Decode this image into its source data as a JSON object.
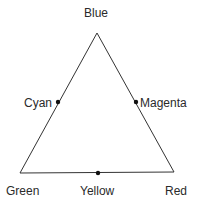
{
  "diagram": {
    "type": "color-triangle",
    "line_color": "#333333",
    "vertices": [
      {
        "name": "Blue",
        "x": 97,
        "y": 33
      },
      {
        "name": "Green",
        "x": 20,
        "y": 173
      },
      {
        "name": "Red",
        "x": 174,
        "y": 172
      }
    ],
    "midpoints": [
      {
        "name": "Cyan",
        "x": 58,
        "y": 102,
        "between": [
          "Blue",
          "Green"
        ]
      },
      {
        "name": "Magenta",
        "x": 136,
        "y": 102,
        "between": [
          "Blue",
          "Red"
        ]
      },
      {
        "name": "Yellow",
        "x": 98,
        "y": 173,
        "between": [
          "Green",
          "Red"
        ]
      }
    ]
  },
  "labels": {
    "blue": "Blue",
    "cyan": "Cyan",
    "magenta": "Magenta",
    "green": "Green",
    "yellow": "Yellow",
    "red": "Red"
  }
}
